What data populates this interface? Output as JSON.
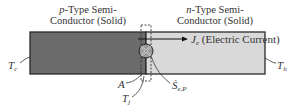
{
  "diagram": {
    "p_type": {
      "prefix": "p",
      "line1_rest": "-Type Semi-",
      "line2": "Conductor (Solid)",
      "fill": "#6b6b6b"
    },
    "n_type": {
      "prefix": "n",
      "line1_rest": "-Type Semi-",
      "line2": "Conductor (Solid)",
      "fill": "#d9d9d9"
    },
    "current": {
      "symbol": "J",
      "subscript": "e",
      "label": "(Electric Current)"
    },
    "labels": {
      "cold": {
        "symbol": "T",
        "subscript": "c"
      },
      "hot": {
        "symbol": "T",
        "subscript": "h"
      },
      "area": {
        "symbol": "A"
      },
      "junction_temp": {
        "symbol": "T",
        "subscript": "j"
      },
      "heat_source": {
        "symbol": "Ṡ",
        "subscript": "e,P"
      }
    },
    "colors": {
      "outline": "#2a2a2a",
      "background": "#ffffff"
    }
  }
}
